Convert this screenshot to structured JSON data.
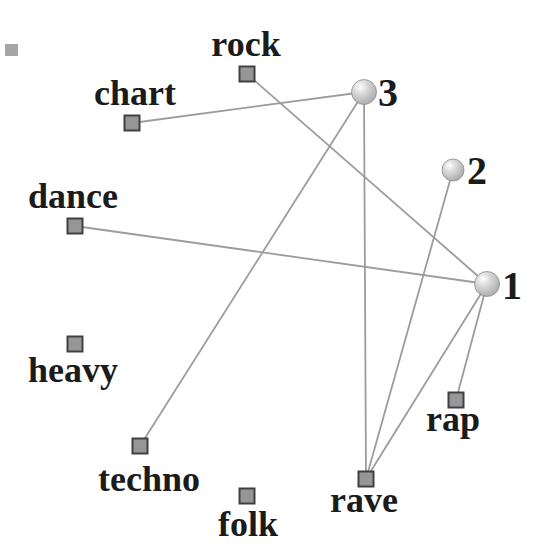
{
  "figure": {
    "background": "#ffffff",
    "text_color": "#1b1b1b",
    "edge_color": "#9c9c9c",
    "square_style": {
      "fill": "#969696",
      "border": "#404040",
      "size": 15
    },
    "sphere_style": {
      "highlight": "#ffffff",
      "mid": "#d8d8d8",
      "outer": "#9e9e9e",
      "stroke": "#8c8c8c"
    },
    "genres": [
      {
        "id": "rock",
        "label": "rock",
        "x": 247,
        "y": 74,
        "label_x": 246,
        "label_y": 56
      },
      {
        "id": "chart",
        "label": "chart",
        "x": 132,
        "y": 123,
        "label_x": 135,
        "label_y": 105
      },
      {
        "id": "dance",
        "label": "dance",
        "x": 75,
        "y": 226,
        "label_x": 73,
        "label_y": 208
      },
      {
        "id": "heavy",
        "label": "heavy",
        "x": 75,
        "y": 344,
        "label_x": 73,
        "label_y": 382
      },
      {
        "id": "techno",
        "label": "techno",
        "x": 140,
        "y": 446,
        "label_x": 149,
        "label_y": 491
      },
      {
        "id": "folk",
        "label": "folk",
        "x": 247,
        "y": 496,
        "label_x": 248,
        "label_y": 536
      },
      {
        "id": "rave",
        "label": "rave",
        "x": 366,
        "y": 479,
        "label_x": 364,
        "label_y": 512
      },
      {
        "id": "rap",
        "label": "rap",
        "x": 456,
        "y": 400,
        "label_x": 453,
        "label_y": 431
      }
    ],
    "clusters": [
      {
        "id": "c1",
        "label": "1",
        "x": 487,
        "y": 284,
        "r": 12.5,
        "label_x": 502,
        "label_y": 299
      },
      {
        "id": "c2",
        "label": "2",
        "x": 453,
        "y": 170,
        "r": 11,
        "label_x": 467,
        "label_y": 184
      },
      {
        "id": "c3",
        "label": "3",
        "x": 364,
        "y": 92,
        "r": 12.5,
        "label_x": 378,
        "label_y": 106
      }
    ],
    "edges": [
      {
        "from": "chart",
        "to": "c3"
      },
      {
        "from": "techno",
        "to": "c3"
      },
      {
        "from": "rave",
        "to": "c3"
      },
      {
        "from": "rave",
        "to": "c2"
      },
      {
        "from": "rave",
        "to": "c1"
      },
      {
        "from": "rock",
        "to": "c1"
      },
      {
        "from": "dance",
        "to": "c1"
      },
      {
        "from": "rap",
        "to": "c1"
      }
    ],
    "artifact": {
      "x": 5,
      "y": 44,
      "w": 13,
      "h": 12,
      "color": "#a6a6a6"
    }
  }
}
